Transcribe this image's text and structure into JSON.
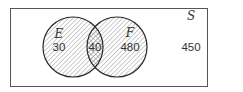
{
  "diagram": {
    "type": "venn",
    "universe": {
      "label": "S",
      "outside_count": "450"
    },
    "sets": [
      {
        "label": "E",
        "only_count": "30"
      },
      {
        "label": "F",
        "only_count": "480"
      }
    ],
    "intersection": {
      "label": "E∩F",
      "count": "40"
    },
    "colors": {
      "stroke": "#2b2b2b",
      "hatch": "#9a9a9a",
      "background": "#ffffff"
    }
  }
}
